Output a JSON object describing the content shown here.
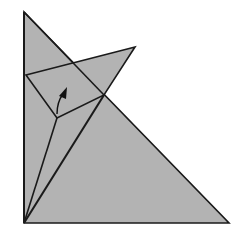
{
  "diagram": {
    "type": "origami-fold-step",
    "colors": {
      "background": "#ffffff",
      "paper_fill": "#b3b3b3",
      "stroke": "#1a1a1a",
      "arrow": "#111111"
    },
    "shapes": {
      "base_triangle": [
        [
          24,
          12
        ],
        [
          24,
          223
        ],
        [
          229,
          223
        ]
      ],
      "upper_flap": [
        [
          26,
          75
        ],
        [
          135,
          47
        ],
        [
          104,
          95
        ],
        [
          57,
          118
        ]
      ],
      "crease_left": [
        [
          24,
          223
        ],
        [
          57,
          118
        ]
      ],
      "crease_right": [
        [
          24,
          223
        ],
        [
          104,
          95
        ]
      ]
    },
    "arrow": {
      "label": "fold-up-arrow",
      "from": [
        57,
        114
      ],
      "to": [
        66,
        88
      ]
    }
  }
}
